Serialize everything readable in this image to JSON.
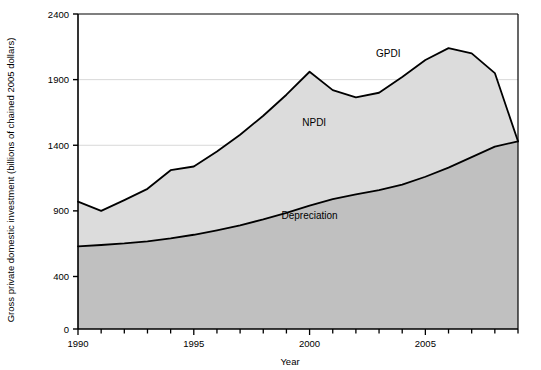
{
  "chart_data": {
    "type": "area",
    "stacked": true,
    "title": "",
    "xlabel": "Year",
    "ylabel": "Gross private domestic investment (billions of chained 2005 dollars)",
    "x": [
      1990,
      1991,
      1992,
      1993,
      1994,
      1995,
      1996,
      1997,
      1998,
      1999,
      2000,
      2001,
      2002,
      2003,
      2004,
      2005,
      2006,
      2007,
      2008,
      2009
    ],
    "xlim": [
      1990,
      2009
    ],
    "ylim": [
      0,
      2400
    ],
    "yticks": [
      0,
      400,
      900,
      1400,
      1900,
      2400
    ],
    "xticks": [
      1990,
      1995,
      2000,
      2005
    ],
    "xtick_labels": [
      "1990",
      "1995",
      "2000",
      "2005"
    ],
    "ytick_labels": [
      "0",
      "400",
      "900",
      "1400",
      "1900",
      "2400"
    ],
    "grid": "horizontal",
    "gridlines_at": [
      1400,
      1900
    ],
    "series": [
      {
        "name": "Depreciation",
        "label": "Depreciation",
        "color": "#c0c0c0",
        "values": [
          630,
          640,
          652,
          668,
          690,
          718,
          752,
          790,
          835,
          885,
          940,
          990,
          1025,
          1058,
          1100,
          1160,
          1230,
          1310,
          1390,
          1430
        ]
      },
      {
        "name": "NPDI",
        "label": "NPDI",
        "color": "#dcdcdc",
        "values": [
          340,
          260,
          330,
          400,
          520,
          520,
          600,
          690,
          790,
          900,
          1020,
          830,
          740,
          742,
          820,
          890,
          910,
          790,
          560,
          0
        ]
      }
    ],
    "total_series": {
      "name": "GPDI",
      "label": "GPDI",
      "values": [
        970,
        900,
        982,
        1068,
        1210,
        1238,
        1352,
        1480,
        1625,
        1785,
        1960,
        1820,
        1765,
        1800,
        1920,
        2050,
        2140,
        2100,
        1950,
        1430
      ]
    },
    "annotations": [
      {
        "text": "GPDI",
        "x": 2003.4,
        "y": 2070
      },
      {
        "text": "NPDI",
        "x": 2000.2,
        "y": 1545
      },
      {
        "text": "Depreciation",
        "x": 2000.0,
        "y": 840
      }
    ],
    "colors": {
      "depreciation_fill": "#c0c0c0",
      "npdi_fill": "#dcdcdc",
      "line": "#000000",
      "axis": "#000000",
      "gridline": "#d8d8d8",
      "background": "#ffffff"
    }
  }
}
